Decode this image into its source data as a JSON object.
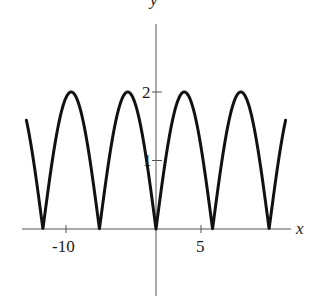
{
  "chart_data": {
    "type": "line",
    "title": "",
    "function": "y = 2|sin(x/2)|",
    "xlabel": "x",
    "ylabel": "y",
    "xlim": [
      -14.4,
      14.4
    ],
    "ylim": [
      0,
      2
    ],
    "x_ticks": [
      {
        "value": -10,
        "label": "-10"
      },
      {
        "value": 5,
        "label": "5"
      }
    ],
    "y_ticks": [
      {
        "value": 1,
        "label": "1"
      },
      {
        "value": 2,
        "label": "2"
      }
    ],
    "grid": false,
    "legend": null,
    "series": [
      {
        "name": "2|sin(x/2)|",
        "color": "#111111",
        "domain": [
          -14.4,
          14.4
        ],
        "zeros": [
          -12.566,
          -6.283,
          0,
          6.283,
          12.566
        ],
        "maxima": [
          [
            -9.425,
            2
          ],
          [
            -3.142,
            2
          ],
          [
            3.142,
            2
          ],
          [
            9.425,
            2
          ]
        ],
        "endpoints": [
          [
            -14.4,
            1.74
          ],
          [
            14.4,
            1.74
          ]
        ]
      }
    ]
  },
  "axes": {
    "x_label": "x",
    "y_label": "y",
    "x_tick_labels": [
      "-10",
      "5"
    ],
    "y_tick_labels": [
      "1",
      "2"
    ]
  }
}
